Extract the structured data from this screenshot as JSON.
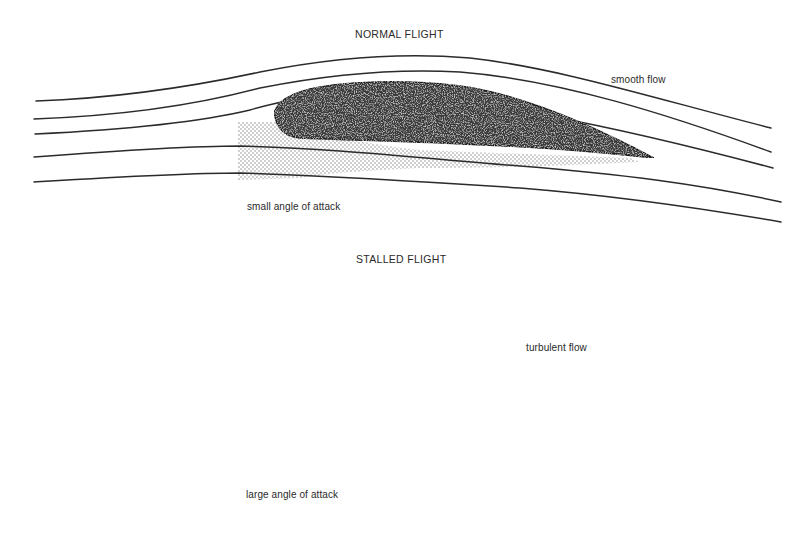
{
  "diagram": {
    "panels": [
      {
        "id": "normal",
        "title": "NORMAL FLIGHT",
        "flow_label": "smooth flow",
        "angle_label": "small angle of attack"
      },
      {
        "id": "stalled",
        "title": "STALLED FLIGHT",
        "flow_label": "turbulent flow",
        "angle_label": "large angle of attack"
      }
    ],
    "colors": {
      "background": "#ffffff",
      "line": "#2b2b2b",
      "airfoil_fill": "#3a3a3a",
      "wake_dots": "#8a8a8a",
      "text": "#2a2a2a"
    }
  }
}
